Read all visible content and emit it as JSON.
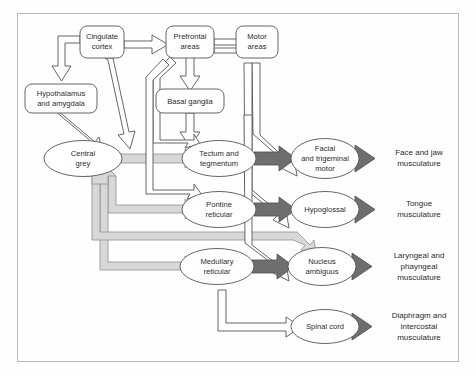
{
  "figure": {
    "background_color": "#fefefe",
    "frame_color": "#b9b9b9",
    "node_stroke": "#555555",
    "node_fill": "#ffffff",
    "arrow_outline_stroke": "#555555",
    "arrow_outline_fill": "#ffffff",
    "arrow_light_fill": "#d6d6d6",
    "arrow_light_stroke": "#8c8c8c",
    "arrow_dark_fill": "#6e6e6e",
    "arrow_dark_stroke": "#4a4a4a",
    "text_color": "#2b2b2b"
  },
  "nodes": {
    "cingulate_cortex": {
      "label_line1": "Cingulate",
      "label_line2": "cortex",
      "shape": "rounded-rect"
    },
    "prefrontal_areas": {
      "label_line1": "Prefrontal",
      "label_line2": "areas",
      "shape": "rounded-rect"
    },
    "motor_areas": {
      "label_line1": "Motor",
      "label_line2": "areas",
      "shape": "rounded-rect"
    },
    "hypothalamus_amygdala": {
      "label_line1": "Hypothalamus",
      "label_line2": "and amygdala",
      "shape": "rounded-rect"
    },
    "basal_ganglia": {
      "label_line1": "Basal ganglia",
      "label_line2": "",
      "shape": "rounded-rect"
    },
    "central_grey": {
      "label_line1": "Central",
      "label_line2": "grey",
      "shape": "ellipse"
    },
    "tectum_tegmentum": {
      "label_line1": "Tectum and",
      "label_line2": "tegmentum",
      "shape": "ellipse"
    },
    "pontine_reticular": {
      "label_line1": "Pontine",
      "label_line2": "reticular",
      "shape": "ellipse"
    },
    "medullary_reticular": {
      "label_line1": "Medullary",
      "label_line2": "reticular",
      "shape": "ellipse"
    },
    "facial_trigeminal_motor": {
      "label_line1": "Facial",
      "label_line2": "and trigeminal",
      "label_line3": "motor",
      "shape": "ellipse"
    },
    "hypoglossal": {
      "label_line1": "Hypoglossal",
      "label_line2": "",
      "shape": "ellipse"
    },
    "nucleus_ambiguus": {
      "label_line1": "Nucleus",
      "label_line2": "ambiguus",
      "shape": "ellipse"
    },
    "spinal_cord": {
      "label_line1": "Spinal cord",
      "label_line2": "",
      "shape": "ellipse"
    }
  },
  "outputs": [
    {
      "id": "face_jaw",
      "line1": "Face and jaw",
      "line2": "musculature",
      "line3": ""
    },
    {
      "id": "tongue",
      "line1": "Tongue",
      "line2": "musculature",
      "line3": ""
    },
    {
      "id": "laryngeal_pharyngeal",
      "line1": "Laryngeal and",
      "line2": "phayngeal",
      "line3": "musculature"
    },
    {
      "id": "diaphragm_intercostal",
      "line1": "Diaphragm and",
      "line2": "intercostal",
      "line3": "musculature"
    }
  ],
  "edges": [
    {
      "from": "cingulate_cortex",
      "to": "prefrontal_areas",
      "style": "outline"
    },
    {
      "from": "prefrontal_areas",
      "to": "motor_areas",
      "style": "outline"
    },
    {
      "from": "motor_areas",
      "to": "prefrontal_areas",
      "style": "thin-line"
    },
    {
      "from": "cingulate_cortex",
      "to": "hypothalamus_amygdala",
      "style": "outline"
    },
    {
      "from": "cingulate_cortex",
      "to": "central_grey",
      "style": "outline"
    },
    {
      "from": "hypothalamus_amygdala",
      "to": "central_grey",
      "style": "outline"
    },
    {
      "from": "prefrontal_areas",
      "to": "basal_ganglia",
      "style": "outline"
    },
    {
      "from": "basal_ganglia",
      "to": "tectum_tegmentum",
      "style": "outline"
    },
    {
      "from": "prefrontal_areas",
      "to": "tectum_tegmentum",
      "style": "outline"
    },
    {
      "from": "prefrontal_areas",
      "to": "pontine_reticular",
      "style": "outline"
    },
    {
      "from": "central_grey",
      "to": "tectum_tegmentum",
      "style": "light"
    },
    {
      "from": "central_grey",
      "to": "pontine_reticular",
      "style": "light"
    },
    {
      "from": "central_grey",
      "to": "medullary_reticular",
      "style": "light"
    },
    {
      "from": "central_grey",
      "to": "nucleus_ambiguus",
      "style": "light"
    },
    {
      "from": "feedback",
      "to": "central_grey",
      "style": "light"
    },
    {
      "from": "motor_areas",
      "to": "facial_trigeminal_motor",
      "style": "outline"
    },
    {
      "from": "motor_areas",
      "to": "hypoglossal",
      "style": "outline"
    },
    {
      "from": "motor_areas",
      "to": "nucleus_ambiguus",
      "style": "outline"
    },
    {
      "from": "tectum_tegmentum",
      "to": "facial_trigeminal_motor",
      "style": "dark"
    },
    {
      "from": "pontine_reticular",
      "to": "hypoglossal",
      "style": "dark"
    },
    {
      "from": "medullary_reticular",
      "to": "nucleus_ambiguus",
      "style": "dark"
    },
    {
      "from": "medullary_reticular",
      "to": "spinal_cord",
      "style": "outline"
    },
    {
      "from": "facial_trigeminal_motor",
      "to": "face_jaw",
      "style": "dark"
    },
    {
      "from": "hypoglossal",
      "to": "tongue",
      "style": "dark"
    },
    {
      "from": "nucleus_ambiguus",
      "to": "laryngeal_pharyngeal",
      "style": "dark"
    },
    {
      "from": "spinal_cord",
      "to": "diaphragm_intercostal",
      "style": "dark"
    }
  ]
}
